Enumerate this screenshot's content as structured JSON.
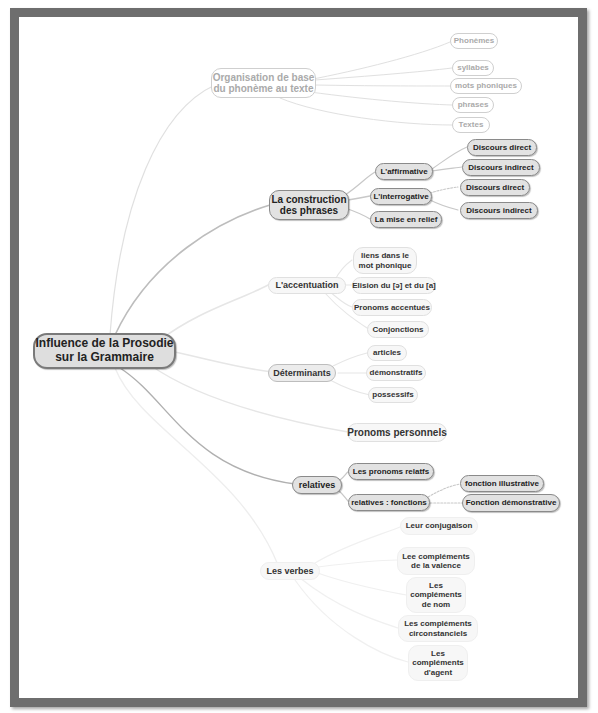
{
  "mindmap": {
    "root": "Influence de la Prosodie sur la Grammaire",
    "branches": {
      "organisation": {
        "label": "Organisation de base du phonème au texte",
        "children": [
          "Phonèmes",
          "syllabes",
          "mots phoniques",
          "phrases",
          "Textes"
        ]
      },
      "construction": {
        "label": "La construction des phrases",
        "affirmative": {
          "label": "L'affirmative",
          "children": [
            "Discours direct",
            "Discours indirect"
          ]
        },
        "interrogative": {
          "label": "L'interrogative",
          "children": [
            "Discours direct",
            "Discours indirect"
          ]
        },
        "relief": "La mise en relief"
      },
      "accentuation": {
        "label": "L'accentuation",
        "children": [
          "liens dans le mot phonique",
          "Elision du [ə] et du [a]",
          "Pronoms accentués",
          "Conjonctions"
        ]
      },
      "determinants": {
        "label": "Déterminants",
        "children": [
          "articles",
          "démonstratifs",
          "possessifs"
        ]
      },
      "pronoms": "Pronoms personnels",
      "relatives": {
        "label": "relatives",
        "pronoms": "Les pronoms relatfs",
        "fonctions": {
          "label": "relatives : fonctions",
          "children": [
            "fonction illustrative",
            "Fonction démonstrative"
          ]
        }
      },
      "verbes": {
        "label": "Les verbes",
        "children": [
          "Leur conjugaison",
          "Lee compléments de la valence",
          "Les compléments de nom",
          "Les compléments circonstanciels",
          "Les compléments d'agent"
        ]
      }
    }
  },
  "colors": {
    "frame": "#6e6e6e",
    "node_fill": "#e2e2e2",
    "node_border": "#8a8a8a",
    "link": "#c8c8c8",
    "faded_text": "#aaaaaa"
  }
}
